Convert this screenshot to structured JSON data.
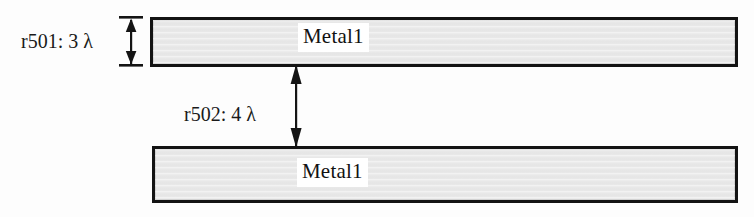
{
  "figure": {
    "background_color": "#fdfdfd"
  },
  "colors": {
    "bar_fill": "#e9e9e9",
    "bar_border": "#131313",
    "label_patch": "#ffffff",
    "text": "#1a1a1a",
    "arrow": "#141414"
  },
  "bars": [
    {
      "name": "top",
      "label": "Metal1",
      "x": 150,
      "y": 17,
      "width": 588,
      "height": 50
    },
    {
      "name": "bottom",
      "label": "Metal1",
      "x": 152,
      "y": 146,
      "width": 586,
      "height": 57
    }
  ],
  "dimensions": [
    {
      "id": "r501",
      "label": "r501: 3  λ",
      "rule": "r501",
      "value": 3,
      "unit": "λ",
      "measures": "width",
      "arrow_style": "double-headed-with-ticks",
      "span_top": 17,
      "span_bottom": 66
    },
    {
      "id": "r502",
      "label": "r502: 4  λ",
      "rule": "r502",
      "value": 4,
      "unit": "λ",
      "measures": "spacing",
      "arrow_style": "double-headed",
      "span_top": 66,
      "span_bottom": 146
    }
  ]
}
